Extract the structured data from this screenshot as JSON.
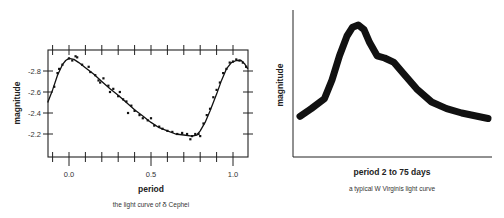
{
  "chart_data": [
    {
      "type": "scatter",
      "title": "the light curve of δ Cephei",
      "xlabel": "period",
      "ylabel": "magnitude",
      "xlim": [
        -0.13,
        1.09
      ],
      "ylim": [
        -2.0,
        -2.95
      ],
      "y_inverted": true,
      "x_ticks": [
        0.0,
        0.5,
        1.0
      ],
      "x_tick_labels": [
        "0.0",
        "0.5",
        "1.0"
      ],
      "y_ticks": [
        -2.8,
        -2.6,
        -2.4,
        -2.2
      ],
      "y_tick_labels": [
        "-2.8",
        "-2.6",
        "-2.4",
        "-2.2"
      ],
      "grid": false,
      "legend": null,
      "series": [
        {
          "name": "fitted curve",
          "kind": "line",
          "x": [
            -0.13,
            -0.1,
            -0.07,
            -0.04,
            -0.02,
            0.0,
            0.03,
            0.06,
            0.1,
            0.15,
            0.2,
            0.25,
            0.3,
            0.35,
            0.4,
            0.45,
            0.5,
            0.55,
            0.6,
            0.65,
            0.7,
            0.75,
            0.78,
            0.8,
            0.83,
            0.86,
            0.9,
            0.93,
            0.96,
            0.99,
            1.02,
            1.05,
            1.07,
            1.09
          ],
          "y": [
            -2.5,
            -2.62,
            -2.76,
            -2.86,
            -2.9,
            -2.92,
            -2.91,
            -2.88,
            -2.83,
            -2.77,
            -2.7,
            -2.63,
            -2.57,
            -2.5,
            -2.43,
            -2.37,
            -2.31,
            -2.26,
            -2.23,
            -2.2,
            -2.19,
            -2.18,
            -2.19,
            -2.23,
            -2.31,
            -2.42,
            -2.58,
            -2.71,
            -2.82,
            -2.88,
            -2.9,
            -2.9,
            -2.87,
            -2.82
          ]
        },
        {
          "name": "observations",
          "kind": "points",
          "x": [
            -0.09,
            -0.07,
            -0.06,
            -0.04,
            0.0,
            0.02,
            0.04,
            0.05,
            0.08,
            0.12,
            0.13,
            0.16,
            0.18,
            0.19,
            0.21,
            0.24,
            0.25,
            0.27,
            0.3,
            0.31,
            0.33,
            0.35,
            0.36,
            0.38,
            0.4,
            0.43,
            0.45,
            0.48,
            0.5,
            0.52,
            0.55,
            0.57,
            0.6,
            0.63,
            0.66,
            0.69,
            0.72,
            0.74,
            0.75,
            0.77,
            0.79,
            0.8,
            0.82,
            0.84,
            0.86,
            0.88,
            0.9,
            0.92,
            0.94,
            0.96,
            0.98,
            1.0,
            1.02,
            1.04,
            1.06,
            1.08
          ],
          "y": [
            -2.65,
            -2.78,
            -2.82,
            -2.86,
            -2.92,
            -2.9,
            -2.94,
            -2.93,
            -2.86,
            -2.84,
            -2.79,
            -2.76,
            -2.71,
            -2.69,
            -2.73,
            -2.66,
            -2.6,
            -2.63,
            -2.56,
            -2.6,
            -2.53,
            -2.51,
            -2.4,
            -2.47,
            -2.42,
            -2.38,
            -2.35,
            -2.33,
            -2.35,
            -2.28,
            -2.27,
            -2.25,
            -2.23,
            -2.22,
            -2.2,
            -2.21,
            -2.2,
            -2.15,
            -2.18,
            -2.2,
            -2.2,
            -2.18,
            -2.3,
            -2.38,
            -2.44,
            -2.55,
            -2.62,
            -2.69,
            -2.78,
            -2.82,
            -2.88,
            -2.89,
            -2.91,
            -2.9,
            -2.88,
            -2.84
          ]
        }
      ]
    },
    {
      "type": "line",
      "title": "a typical W Virginis light curve",
      "xlabel": "period 2 to 75 days",
      "ylabel": "magnitude",
      "grid": false,
      "legend": null,
      "x_ticks": [],
      "y_ticks": [],
      "series": [
        {
          "name": "W Virginis light curve (schematic, normalized 0-1)",
          "x": [
            0.0,
            0.06,
            0.13,
            0.17,
            0.21,
            0.25,
            0.28,
            0.31,
            0.34,
            0.37,
            0.41,
            0.45,
            0.5,
            0.55,
            0.62,
            0.7,
            0.78,
            0.86,
            1.0
          ],
          "y": [
            0.17,
            0.24,
            0.33,
            0.5,
            0.72,
            0.9,
            0.98,
            1.0,
            0.96,
            0.84,
            0.72,
            0.7,
            0.66,
            0.56,
            0.42,
            0.3,
            0.24,
            0.2,
            0.15
          ]
        }
      ]
    }
  ],
  "left_chart": {
    "ylabel": "magnitude",
    "xlabel": "period",
    "caption_prefix": "the light curve of ",
    "caption_symbol": "δ",
    "caption_suffix": " Cephei",
    "x_tick_labels": [
      "0.0",
      "0.5",
      "1.0"
    ],
    "y_tick_labels": [
      "-2.8",
      "-2.6",
      "-2.4",
      "-2.2"
    ]
  },
  "right_chart": {
    "ylabel": "magnitude",
    "xlabel": "period 2 to 75 days",
    "caption": "a typical W Virginis light curve"
  }
}
